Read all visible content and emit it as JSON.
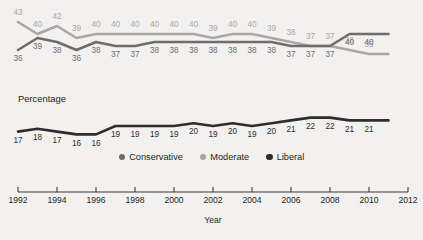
{
  "chart_data": {
    "type": "line",
    "title": "",
    "xlabel": "Year",
    "ylabel": "Percentage",
    "x": [
      1992,
      1993,
      1994,
      1995,
      1996,
      1997,
      1998,
      1999,
      2000,
      2001,
      2002,
      2003,
      2004,
      2005,
      2006,
      2007,
      2008,
      2009,
      2010,
      2011
    ],
    "xlim": [
      1992,
      2012
    ],
    "xticks": [
      1992,
      1994,
      1996,
      1998,
      2000,
      2002,
      2004,
      2006,
      2008,
      2010,
      2012
    ],
    "xticklabels": [
      "1992",
      "1994",
      "1996",
      "1998",
      "2000",
      "2002",
      "2004",
      "2006",
      "2008",
      "2010",
      "2012"
    ],
    "grid": false,
    "legend_position": "bottom-center",
    "panels": [
      {
        "name": "upper-panel",
        "ylim": [
          33,
          44
        ],
        "series": [
          {
            "name": "Moderate",
            "color": "#a9a7a4",
            "values": [
              43,
              40,
              42,
              39,
              40,
              40,
              40,
              40,
              40,
              40,
              39,
              40,
              40,
              39,
              38,
              37,
              37,
              36,
              35,
              35
            ],
            "label_side": "above"
          },
          {
            "name": "Conservative",
            "color": "#6f6d6b",
            "values": [
              36,
              39,
              38,
              36,
              38,
              37,
              37,
              38,
              38,
              38,
              38,
              38,
              38,
              38,
              37,
              37,
              37,
              40,
              40,
              40
            ],
            "label_side": "below"
          }
        ]
      },
      {
        "name": "lower-panel",
        "ylim": [
          14,
          24
        ],
        "series": [
          {
            "name": "Liberal",
            "color": "#2f2c2b",
            "values": [
              17,
              18,
              17,
              16,
              16,
              19,
              19,
              19,
              19,
              20,
              19,
              20,
              19,
              20,
              21,
              22,
              22,
              21,
              21,
              21
            ],
            "label_side": "below"
          }
        ]
      }
    ],
    "legend": [
      {
        "label": "Conservative",
        "color": "#6f6d6b"
      },
      {
        "label": "Moderate",
        "color": "#a9a7a4"
      },
      {
        "label": "Liberal",
        "color": "#2f2c2b"
      }
    ],
    "upper_labels_moderate": [
      43,
      40,
      42,
      39,
      40,
      40,
      40,
      40,
      40,
      40,
      39,
      40,
      40,
      39,
      38,
      37,
      37,
      36,
      35
    ],
    "upper_labels_conservative": [
      36,
      39,
      38,
      36,
      38,
      37,
      37,
      38,
      38,
      38,
      38,
      38,
      38,
      38,
      37,
      37,
      37,
      40,
      40
    ],
    "lower_labels_liberal": [
      17,
      18,
      17,
      16,
      16,
      19,
      19,
      19,
      19,
      20,
      19,
      20,
      19,
      20,
      21,
      22,
      22,
      21,
      21
    ]
  },
  "colors": {
    "background": "#f2f1ef",
    "axis": "#3b3a38",
    "conservative": "#6f6d6b",
    "moderate": "#a9a7a4",
    "liberal": "#2f2c2b"
  }
}
